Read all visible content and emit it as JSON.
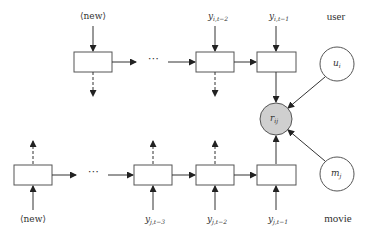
{
  "diagram": {
    "type": "recurrent-recommender-network",
    "user_chain": {
      "row_label": "user",
      "input_labels": [
        {
          "base": "⟨new⟩",
          "sub": ""
        },
        {
          "base": "y",
          "sub": "i,t−2"
        },
        {
          "base": "y",
          "sub": "i,t−1"
        }
      ],
      "ellipsis": "⋯",
      "static_node": {
        "base": "u",
        "sub": "i"
      }
    },
    "movie_chain": {
      "row_label": "movie",
      "input_labels": [
        {
          "base": "⟨new⟩",
          "sub": ""
        },
        {
          "base": "y",
          "sub": "j,t−3"
        },
        {
          "base": "y",
          "sub": "j,t−2"
        },
        {
          "base": "y",
          "sub": "j,t−1"
        }
      ],
      "ellipsis": "⋯",
      "static_node": {
        "base": "m",
        "sub": "j"
      }
    },
    "output_node": {
      "base": "r",
      "sub": "ij",
      "fill": "#cfcfcf"
    },
    "colors": {
      "stroke": "#555555",
      "text": "#333333",
      "observed_fill": "#cfcfcf"
    }
  }
}
